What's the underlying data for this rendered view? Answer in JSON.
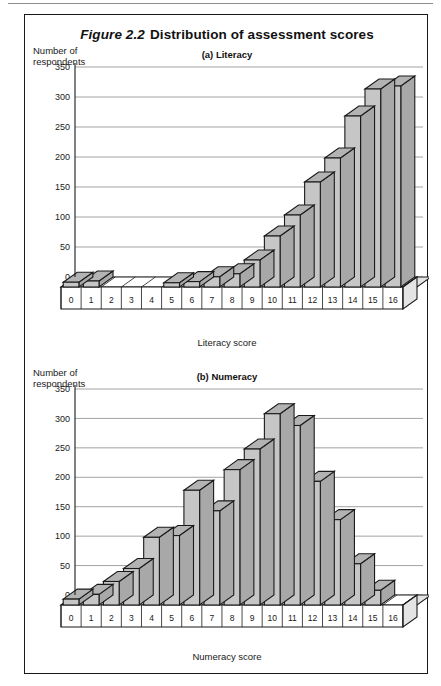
{
  "figure": {
    "number": "Figure 2.2",
    "title": "Distribution of assessment scores"
  },
  "panels": {
    "a": {
      "heading": "(a) Literacy",
      "ylabel_line1": "Number of",
      "ylabel_line2": "respondents",
      "xlabel": "Literacy score"
    },
    "b": {
      "heading": "(b) Numeracy",
      "ylabel_line1": "Number of",
      "ylabel_line2": "respondents",
      "xlabel": "Numeracy score"
    }
  },
  "chart_data": [
    {
      "type": "bar",
      "title": "(a) Literacy",
      "xlabel": "Literacy score",
      "ylabel": "Number of respondents",
      "categories": [
        "0",
        "1",
        "2",
        "3",
        "4",
        "5",
        "6",
        "7",
        "8",
        "9",
        "10",
        "11",
        "12",
        "13",
        "14",
        "15",
        "16"
      ],
      "values": [
        8,
        10,
        0,
        0,
        0,
        7,
        9,
        17,
        22,
        45,
        85,
        120,
        175,
        215,
        285,
        330,
        335
      ],
      "ylim": [
        0,
        350
      ],
      "yticks": [
        0,
        50,
        100,
        150,
        200,
        250,
        300,
        350
      ],
      "grid": true,
      "legend": "none",
      "style": "3d-bar"
    },
    {
      "type": "bar",
      "title": "(b) Numeracy",
      "xlabel": "Numeracy score",
      "ylabel": "Number of respondents",
      "categories": [
        "0",
        "1",
        "2",
        "3",
        "4",
        "5",
        "6",
        "7",
        "8",
        "9",
        "10",
        "11",
        "12",
        "13",
        "14",
        "15",
        "16"
      ],
      "values": [
        10,
        18,
        40,
        62,
        115,
        118,
        195,
        160,
        230,
        265,
        325,
        305,
        210,
        145,
        70,
        25,
        0
      ],
      "ylim": [
        0,
        350
      ],
      "yticks": [
        0,
        50,
        100,
        150,
        200,
        250,
        300,
        350
      ],
      "grid": true,
      "legend": "none",
      "style": "3d-bar"
    }
  ],
  "colors": {
    "bar_front": "#c6c6c6",
    "bar_top": "#b3b3b3",
    "bar_side": "#a8a8a8",
    "outline": "#1a1a1a",
    "grid": "#8c8c8c"
  }
}
